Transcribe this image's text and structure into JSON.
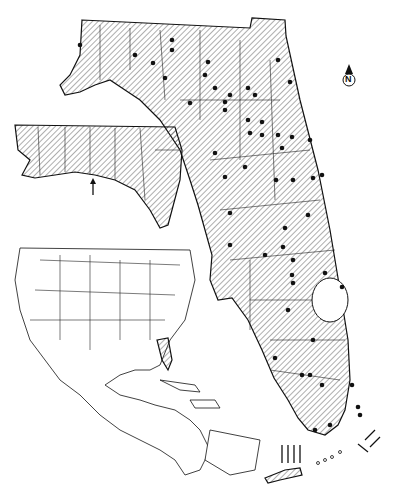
{
  "map": {
    "type": "species distribution map",
    "region": "Florida",
    "north_arrow": {
      "label": "N"
    },
    "legend": {
      "hatched_area": "range",
      "dots": "collection localities",
      "arrows": "isolated records"
    },
    "insets": [
      {
        "name": "panhandle-enlargement",
        "description": "Western panhandle detail with arrow on coast"
      },
      {
        "name": "locator-map",
        "description": "North America, Central America and Caribbean with Florida highlighted"
      }
    ],
    "colors": {
      "ink": "#111111",
      "background": "#ffffff"
    }
  }
}
